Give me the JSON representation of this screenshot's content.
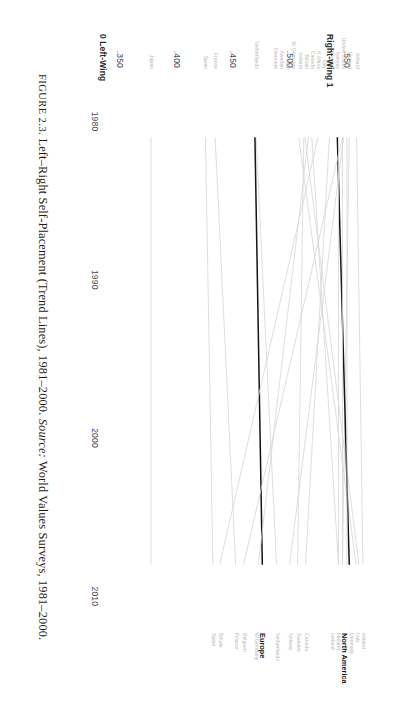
{
  "figure": {
    "caption_prefix": "FIGURE 2.3.",
    "caption_title": "Left–Right Self-Placement (Trend Lines), 1981–2000.",
    "caption_source_label": "Source:",
    "caption_source_text": "World Values Surveys, 1981–2000."
  },
  "axis": {
    "y_low_caption": "0 Left-Wing",
    "y_high_caption": "Right-Wing 1",
    "y_ticks": [
      ".350",
      ".400",
      ".450",
      ".500",
      ".550"
    ],
    "x_ticks": [
      "1980",
      "1990",
      "2000",
      "2010"
    ]
  },
  "colors": {
    "series_faint": "#d8d8d8",
    "series_bold": "#151515",
    "label_faint": "#b9b9b9",
    "label_bold": "#151515",
    "tick_text": "#4a4a4a",
    "background": "#ffffff"
  },
  "chart_data": {
    "type": "line",
    "title": "Left–Right Self-Placement (Trend Lines), 1981–2000",
    "xlabel": "",
    "ylabel": "Left–Right Self-Placement",
    "xlim": [
      1977,
      2012
    ],
    "ylim": [
      0.345,
      0.572
    ],
    "grid": false,
    "legend": "end-labels",
    "x": [
      1981,
      2008
    ],
    "series": [
      {
        "name": "Ireland",
        "start_label": "Ireland",
        "end_label": "Ireland",
        "values": [
          0.5585,
          0.564
        ],
        "emphasis": "faint"
      },
      {
        "name": "Italy",
        "start_label": "Italy",
        "end_label": "Italy",
        "values": [
          0.513,
          0.5605
        ],
        "emphasis": "faint"
      },
      {
        "name": "Denmark",
        "start_label": "Denmark",
        "end_label": "Denmark",
        "values": [
          0.5075,
          0.558
        ],
        "emphasis": "faint"
      },
      {
        "name": "Finland",
        "start_label": "Finland",
        "end_label": "Finland",
        "values": [
          0.552,
          0.546
        ],
        "emphasis": "faint"
      },
      {
        "name": "Iceland",
        "start_label": "Iceland",
        "end_label": "Iceland",
        "values": [
          0.519,
          0.5425
        ],
        "emphasis": "faint"
      },
      {
        "name": "North America",
        "start_label": "",
        "end_label": "North America",
        "values": [
          0.5415,
          0.552
        ],
        "emphasis": "bold"
      },
      {
        "name": "Canada",
        "start_label": "Canada",
        "end_label": "Canada",
        "values": [
          0.5345,
          0.5135
        ],
        "emphasis": "faint"
      },
      {
        "name": "Sweden",
        "start_label": "Sweden",
        "end_label": "Sweden",
        "values": [
          0.512,
          0.5065
        ],
        "emphasis": "faint"
      },
      {
        "name": "Norway",
        "start_label": "Norway",
        "end_label": "Norway",
        "values": [
          0.547,
          0.4995
        ],
        "emphasis": "faint"
      },
      {
        "name": "Netherlands",
        "start_label": "Netherlands",
        "end_label": "Netherlands",
        "values": [
          0.47,
          0.488
        ],
        "emphasis": "faint"
      },
      {
        "name": "Europe",
        "start_label": "",
        "end_label": "Europe",
        "values": [
          0.469,
          0.4755
        ],
        "emphasis": "bold"
      },
      {
        "name": "W.Germany",
        "start_label": "W.Germany",
        "end_label": "W.Germany",
        "values": [
          0.516,
          0.472
        ],
        "emphasis": "faint"
      },
      {
        "name": "Belgium",
        "start_label": "Belgium",
        "end_label": "Belgium",
        "values": [
          0.546,
          0.459
        ],
        "emphasis": "faint"
      },
      {
        "name": "France",
        "start_label": "France",
        "end_label": "France",
        "values": [
          0.434,
          0.452
        ],
        "emphasis": "faint"
      },
      {
        "name": "Britain",
        "start_label": "Britain",
        "end_label": "Britain",
        "values": [
          0.5245,
          0.438
        ],
        "emphasis": "faint"
      },
      {
        "name": "Spain",
        "start_label": "Spain",
        "end_label": "Spain",
        "values": [
          0.4255,
          0.432
        ],
        "emphasis": "faint"
      },
      {
        "name": "United States",
        "start_label": "United States",
        "end_label": "",
        "values": [
          0.55,
          0.55
        ],
        "emphasis": "faint"
      },
      {
        "name": "S.Africa",
        "start_label": "S.Africa",
        "end_label": "",
        "values": [
          0.5425,
          0.5425
        ],
        "emphasis": "faint"
      },
      {
        "name": "Italy_start",
        "start_label": "Italy",
        "end_label": "",
        "values": [
          0.546,
          0.546
        ],
        "emphasis": "faint"
      },
      {
        "name": "Japan",
        "start_label": "Japan",
        "end_label": "",
        "values": [
          0.3775,
          0.3775
        ],
        "emphasis": "faint"
      }
    ],
    "end_labels_right": [
      "Ireland",
      "Italy",
      "Denmark",
      "Finland",
      "Iceland",
      "North America",
      "Canada",
      "Sweden",
      "Norway",
      "Netherlands",
      "Europe",
      "W.Germany",
      "Belgium",
      "France",
      "Britain",
      "Spain"
    ],
    "end_labels_left": [
      "Ireland",
      "Finland",
      "Italy",
      "United States",
      "Denmark",
      "Norway",
      "Belgium",
      "S.Africa",
      "Britain",
      "Iceland",
      "W.Germany",
      "Sweden",
      "Canada",
      "Denmark",
      "Netherlands",
      "France",
      "Spain",
      "Italy"
    ]
  }
}
